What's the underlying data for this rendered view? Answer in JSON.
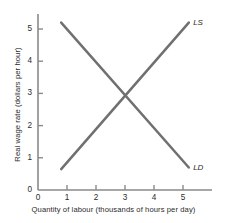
{
  "chart_data": {
    "type": "line",
    "title": "",
    "subtitle": "",
    "xlabel": "Quantity of labour (thousands of hours per day)",
    "ylabel": "Real wage rate (dollars per hour)",
    "xlim": [
      0,
      6
    ],
    "ylim": [
      0,
      5.6
    ],
    "xticks": [
      0,
      1,
      2,
      3,
      4,
      5
    ],
    "yticks": [
      0,
      1,
      2,
      3,
      4,
      5
    ],
    "xtick_labels": [
      "0",
      "1",
      "2",
      "3",
      "4",
      "5"
    ],
    "ytick_labels": [
      "0",
      "1",
      "2",
      "3",
      "4",
      "5"
    ],
    "grid": false,
    "legend": "inline-curve-labels",
    "equilibrium": {
      "x": 3,
      "y": 3
    },
    "series": [
      {
        "name": "LS",
        "label": "LS",
        "description": "labour supply",
        "color": "#707070",
        "label_position": {
          "x": 5.35,
          "y": 5.2
        },
        "points": [
          {
            "x": 0.8,
            "y": 0.65
          },
          {
            "x": 5.2,
            "y": 5.2
          }
        ]
      },
      {
        "name": "LD",
        "label": "LD",
        "description": "labour demand",
        "color": "#707070",
        "label_position": {
          "x": 5.35,
          "y": 0.68
        },
        "points": [
          {
            "x": 0.8,
            "y": 5.2
          },
          {
            "x": 5.2,
            "y": 0.7
          }
        ]
      }
    ],
    "colors": {
      "axis": "#8a8a8a",
      "curve": "#707070",
      "text": "#2b2b2b",
      "background": "#ffffff"
    }
  }
}
